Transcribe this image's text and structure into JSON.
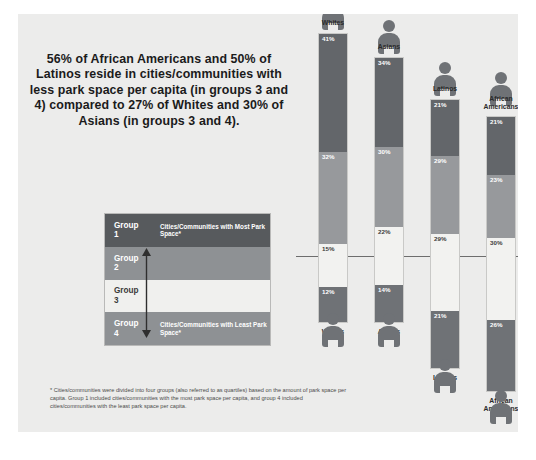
{
  "headline": "56% of African Americans and 50% of Latinos reside in cities/communities with less park space per capita (in groups 3 and 4) compared to 27% of Whites and 30% of Asians (in groups 3 and 4).",
  "legend": {
    "rows": [
      {
        "name": "Group",
        "num": "1",
        "desc": "Cities/Communities with Most Park Space*"
      },
      {
        "name": "Group",
        "num": "2",
        "desc": ""
      },
      {
        "name": "Group",
        "num": "3",
        "desc": ""
      },
      {
        "name": "Group",
        "num": "4",
        "desc": "Cities/Communities with Least Park Space*"
      }
    ],
    "arrow_name": "vertical-double-arrow"
  },
  "footnote": "* Cities/communities were divided into four groups (also referred to as quartiles) based on the amount of park space per capita. Group 1 included cities/communities with the most park space per capita, and group 4 included cities/communities with the least park space per capita.",
  "colors": {
    "group1": "#63666a",
    "group2": "#97999c",
    "group3": "#f2f2f0",
    "group4": "#6f7276",
    "background": "#ececeb",
    "midline": "#6d6d6d"
  },
  "chart_data": {
    "type": "bar",
    "xlabel": "",
    "ylabel": "Percent",
    "ylim": [
      0,
      100
    ],
    "grid": false,
    "legend_position": "left",
    "categories": [
      "Whites",
      "Asians",
      "Latinos",
      "African Americans"
    ],
    "series": [
      {
        "name": "Group 1",
        "values": [
          41,
          34,
          21,
          21
        ],
        "color": "#63666a"
      },
      {
        "name": "Group 2",
        "values": [
          32,
          30,
          29,
          23
        ],
        "color": "#97999c"
      },
      {
        "name": "Group 3",
        "values": [
          15,
          22,
          29,
          30
        ],
        "color": "#f2f2f0"
      },
      {
        "name": "Group 4",
        "values": [
          12,
          14,
          21,
          26
        ],
        "color": "#6f7276"
      }
    ],
    "labels": {
      "whites": [
        "41%",
        "32%",
        "15%",
        "12%"
      ],
      "asians": [
        "34%",
        "30%",
        "22%",
        "14%"
      ],
      "latinos": [
        "21%",
        "29%",
        "29%",
        "21%"
      ],
      "african_americans": [
        "21%",
        "23%",
        "30%",
        "26%"
      ]
    },
    "annotations": [
      "midline separates groups 1-2 from groups 3-4"
    ]
  },
  "columns": [
    {
      "label": "Whites",
      "top": 28,
      "height": 290,
      "segs": [
        {
          "cls": "s1",
          "pct": 41,
          "txt": "41%"
        },
        {
          "cls": "s2",
          "pct": 32,
          "txt": "32%"
        },
        {
          "cls": "s3",
          "pct": 15,
          "txt": "15%"
        },
        {
          "cls": "s4",
          "pct": 12,
          "txt": "12%"
        }
      ]
    },
    {
      "label": "Asians",
      "top": 52,
      "height": 266,
      "segs": [
        {
          "cls": "s1",
          "pct": 34,
          "txt": "34%"
        },
        {
          "cls": "s2",
          "pct": 30,
          "txt": "30%"
        },
        {
          "cls": "s3",
          "pct": 22,
          "txt": "22%"
        },
        {
          "cls": "s4",
          "pct": 14,
          "txt": "14%"
        }
      ]
    },
    {
      "label": "Latinos",
      "top": 94,
      "height": 270,
      "segs": [
        {
          "cls": "s1",
          "pct": 21,
          "txt": "21%"
        },
        {
          "cls": "s2",
          "pct": 29,
          "txt": "29%"
        },
        {
          "cls": "s3",
          "pct": 29,
          "txt": "29%"
        },
        {
          "cls": "s4",
          "pct": 21,
          "txt": "21%"
        }
      ]
    },
    {
      "label": "African Americans",
      "top": 104,
      "height": 276,
      "segs": [
        {
          "cls": "s1",
          "pct": 21,
          "txt": "21%"
        },
        {
          "cls": "s2",
          "pct": 23,
          "txt": "23%"
        },
        {
          "cls": "s3",
          "pct": 30,
          "txt": "30%"
        },
        {
          "cls": "s4",
          "pct": 26,
          "txt": "26%"
        }
      ]
    }
  ],
  "column_x": [
    22,
    78,
    134,
    190
  ]
}
